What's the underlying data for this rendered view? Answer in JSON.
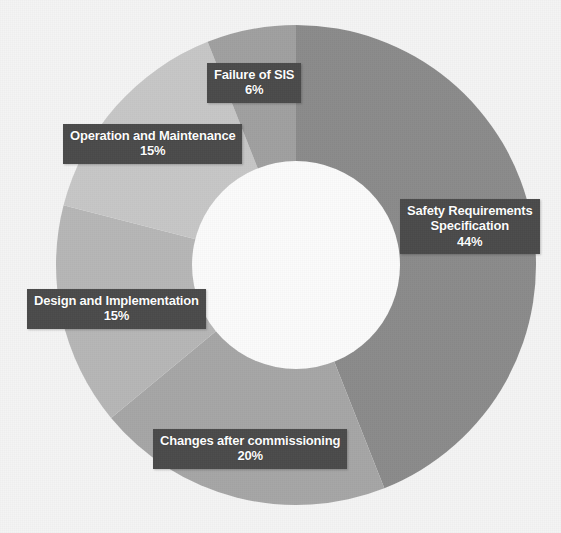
{
  "figure": {
    "background_color": "#f4f4f4",
    "label_box_color": "#4b4b4b",
    "label_text_color": "#ffffff"
  },
  "chart_data": {
    "type": "pie",
    "variant": "donut",
    "title": "",
    "subtitle": "",
    "xlabel": "",
    "ylabel": "",
    "legend": "none",
    "grid": false,
    "start_angle_deg": 0,
    "direction": "clockwise",
    "inner_radius_ratio": 0.44,
    "units": "percent",
    "total": 100,
    "categories": [
      "Safety Requirements Specification",
      "Changes after commissioning",
      "Design and Implementation",
      "Operation and Maintenance",
      "Failure of SIS"
    ],
    "values": [
      44,
      20,
      15,
      15,
      6
    ],
    "value_labels": [
      "44%",
      "20%",
      "15%",
      "15%",
      "6%"
    ],
    "colors": [
      "#8b8b8b",
      "#a6a6a6",
      "#b6b6b6",
      "#c6c6c6",
      "#a0a0a0"
    ],
    "slices": [
      {
        "label": "Safety Requirements Specification",
        "label_lines": [
          "Safety Requirements",
          "Specification"
        ],
        "value": 44,
        "value_label": "44%",
        "color": "#8b8b8b"
      },
      {
        "label": "Changes after commissioning",
        "label_lines": [
          "Changes after commissioning"
        ],
        "value": 20,
        "value_label": "20%",
        "color": "#a6a6a6"
      },
      {
        "label": "Design and Implementation",
        "label_lines": [
          "Design and Implementation"
        ],
        "value": 15,
        "value_label": "15%",
        "color": "#b6b6b6"
      },
      {
        "label": "Operation and Maintenance",
        "label_lines": [
          "Operation and Maintenance"
        ],
        "value": 15,
        "value_label": "15%",
        "color": "#c6c6c6"
      },
      {
        "label": "Failure of SIS",
        "label_lines": [
          "Failure of SIS"
        ],
        "value": 6,
        "value_label": "6%",
        "color": "#a0a0a0"
      }
    ]
  },
  "callouts": [
    {
      "line1": "Safety Requirements",
      "line2": "Specification",
      "pct": "44%"
    },
    {
      "line1": "Changes after commissioning",
      "line2": "",
      "pct": "20%"
    },
    {
      "line1": "Design and Implementation",
      "line2": "",
      "pct": "15%"
    },
    {
      "line1": "Operation and Maintenance",
      "line2": "",
      "pct": "15%"
    },
    {
      "line1": "Failure of SIS",
      "line2": "",
      "pct": "6%"
    }
  ]
}
